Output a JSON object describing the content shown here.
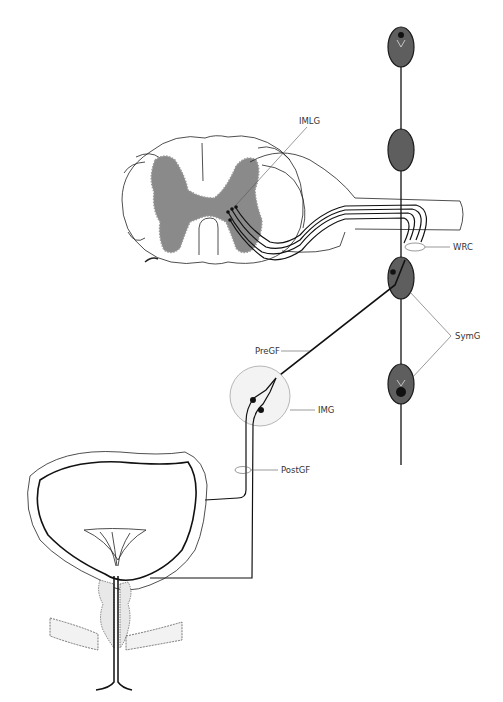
{
  "diagram": {
    "labels": {
      "imlg": "IMLG",
      "wrc": "WRC",
      "symg": "SymG",
      "pregf": "PreGF",
      "img": "IMG",
      "postgf": "PostGF"
    },
    "colors": {
      "gray_matter": "#8a8a8a",
      "ganglion_fill": "#5e5e5e",
      "img_fill": "#f3f3f3",
      "line": "#111111",
      "label_text": "#333333"
    },
    "structures": [
      "spinal-cord-cross-section",
      "gray-matter",
      "ventral-root",
      "sympathetic-chain",
      "chain-ganglia",
      "inferior-mesenteric-ganglion",
      "bladder",
      "bladder-neck",
      "prostate",
      "pelvic-floor"
    ]
  }
}
